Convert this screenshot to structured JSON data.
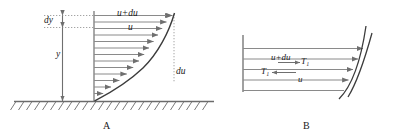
{
  "figure": {
    "type": "diagram",
    "background_color": "#ffffff",
    "line_color": "#8a8a8a",
    "curve_color": "#3c3c3c",
    "text_color": "#1a1a1a"
  },
  "panels": [
    {
      "id": "A",
      "letter": "A",
      "description": "Velocity profile of fluid over a hatched stationary boundary",
      "labels": {
        "dy": "dy",
        "y": "y",
        "u_plus_du": "u+du",
        "u": "u",
        "du": "du"
      },
      "arrow_count": 13,
      "ground": {
        "style": "hatched",
        "hatch_count": 25
      }
    },
    {
      "id": "B",
      "letter": "B",
      "description": "Two adjacent fluid layers with opposing shear stresses",
      "labels": {
        "u_plus_du": "u+du",
        "u": "u",
        "tau_upper": "T₁",
        "tau_lower": "T₁"
      },
      "arrow_count": 5
    }
  ]
}
